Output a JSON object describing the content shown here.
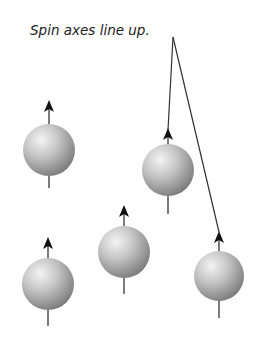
{
  "diagram": {
    "caption": "Spin axes line up.",
    "colors": {
      "sphere_light": "#f2f2f2",
      "sphere_mid": "#bdbdbd",
      "sphere_dark": "#7a7a7a",
      "arrow": "#111111",
      "line": "#333333"
    },
    "spins": [
      {
        "id": 1,
        "cx": 49,
        "cy": 150,
        "r": 26,
        "arrow_tip_y": 100,
        "stem_bottom_y": 188
      },
      {
        "id": 2,
        "cx": 168,
        "cy": 170,
        "r": 26,
        "arrow_tip_y": 128,
        "stem_bottom_y": 214
      },
      {
        "id": 3,
        "cx": 48,
        "cy": 284,
        "r": 26,
        "arrow_tip_y": 237,
        "stem_bottom_y": 326
      },
      {
        "id": 4,
        "cx": 124,
        "cy": 252,
        "r": 26,
        "arrow_tip_y": 205,
        "stem_bottom_y": 294
      },
      {
        "id": 5,
        "cx": 219,
        "cy": 276,
        "r": 25,
        "arrow_tip_y": 231,
        "stem_bottom_y": 318
      }
    ],
    "leader_lines": [
      {
        "from": [
          173,
          37
        ],
        "to": [
          168,
          130
        ]
      },
      {
        "from": [
          173,
          37
        ],
        "to": [
          219,
          232
        ]
      }
    ]
  }
}
